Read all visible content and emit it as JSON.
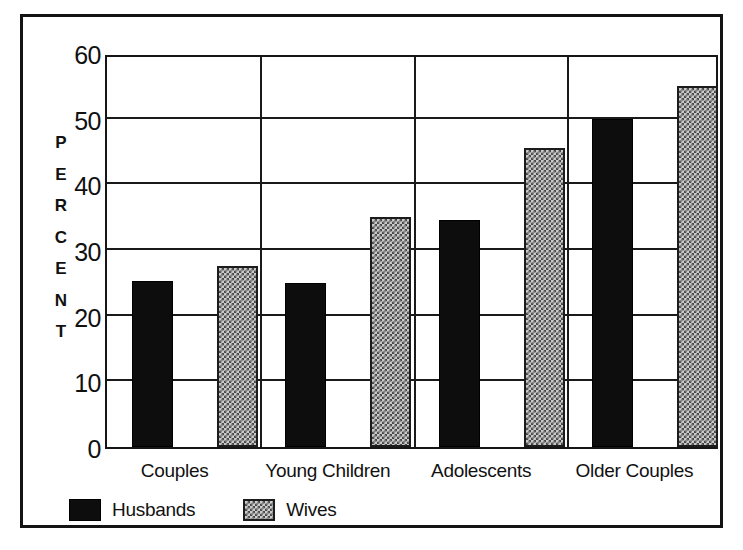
{
  "chart_data": {
    "type": "bar",
    "title": "",
    "subtitle": "",
    "xlabel": "",
    "ylabel": "PERCENT",
    "ylabel_letters": [
      "P",
      "E",
      "R",
      "C",
      "E",
      "N",
      "T"
    ],
    "categories": [
      "Couples",
      "Young Children",
      "Adolescents",
      "Older Couples"
    ],
    "series": [
      {
        "name": "Husbands",
        "values": [
          25.3,
          25.0,
          34.5,
          50.0
        ],
        "fill": "solid-black",
        "color": "#0d0d0d"
      },
      {
        "name": "Wives",
        "values": [
          27.5,
          35.0,
          45.5,
          55.0
        ],
        "fill": "checkerboard-gray",
        "color": "#c9c9c9"
      }
    ],
    "ylim": [
      0,
      60
    ],
    "ytick_values": [
      0,
      10,
      20,
      30,
      40,
      50,
      60
    ],
    "ytick_labels": [
      "0",
      "10",
      "20",
      "30",
      "40",
      "50",
      "60"
    ],
    "grid": true,
    "grid_axis": "both",
    "legend_position": "bottom-left",
    "group_separators": true
  },
  "legend": {
    "entries": [
      {
        "label": "Husbands",
        "swatch": "solid-black-swatch"
      },
      {
        "label": "Wives",
        "swatch": "checkered-gray-swatch"
      }
    ]
  },
  "colors": {
    "frame": "#141414",
    "gridline": "#1a1a1a",
    "background": "#ffffff",
    "husbands": "#0d0d0d",
    "wives": "#c9c9c9",
    "text": "#111111"
  }
}
